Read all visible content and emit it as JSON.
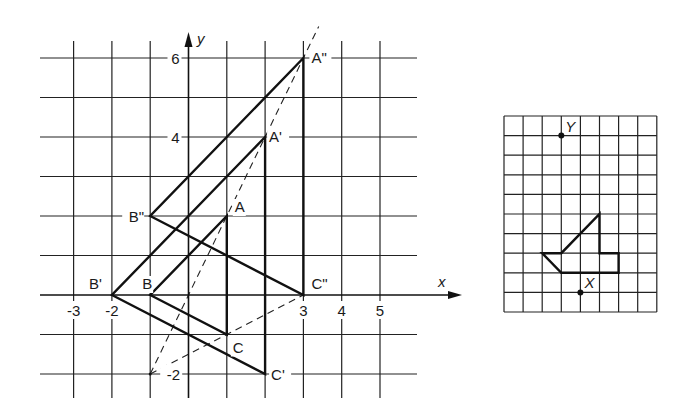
{
  "figure": {
    "left_panel": {
      "title": "Coordinate grid with successive dilations",
      "x_range": [
        -4,
        6
      ],
      "y_range": [
        -3,
        7
      ],
      "axis_labels": {
        "x": "x",
        "y": "y"
      },
      "x_tick_labels": [
        {
          "value": -3,
          "text": "-3"
        },
        {
          "value": -2,
          "text": "-2"
        },
        {
          "value": 3,
          "text": "3"
        },
        {
          "value": 4,
          "text": "4"
        },
        {
          "value": 5,
          "text": "5"
        }
      ],
      "y_tick_labels": [
        {
          "value": 6,
          "text": "6"
        },
        {
          "value": 4,
          "text": "4"
        },
        {
          "value": -2,
          "text": "-2"
        }
      ],
      "triangles": [
        {
          "name": "ABC",
          "vertices": [
            {
              "label": "A",
              "x": 1,
              "y": 2
            },
            {
              "label": "B",
              "x": -1,
              "y": 0
            },
            {
              "label": "C",
              "x": 1,
              "y": -1
            }
          ]
        },
        {
          "name": "A'B'C'",
          "vertices": [
            {
              "label": "A'",
              "x": 2,
              "y": 4
            },
            {
              "label": "B'",
              "x": -2,
              "y": 0
            },
            {
              "label": "C'",
              "x": 2,
              "y": -2
            }
          ]
        },
        {
          "name": "A''B''C''",
          "vertices": [
            {
              "label": "A\"",
              "x": 3,
              "y": 6
            },
            {
              "label": "B\"",
              "x": -1,
              "y": 2
            },
            {
              "label": "C\"",
              "x": 3,
              "y": 0
            }
          ]
        }
      ],
      "dilation_center": {
        "x": -1,
        "y": -2
      },
      "dashed_rays": [
        {
          "from": {
            "x": -1,
            "y": -2
          },
          "to": {
            "x": 3.4,
            "y": 6.8
          }
        },
        {
          "from": {
            "x": -1,
            "y": -2
          },
          "to": {
            "x": 3,
            "y": 0
          }
        }
      ]
    },
    "right_panel": {
      "columns": 8,
      "rows": 10,
      "polygon": [
        {
          "c": 5,
          "r": 5
        },
        {
          "c": 5,
          "r": 7
        },
        {
          "c": 6,
          "r": 7
        },
        {
          "c": 6,
          "r": 8
        },
        {
          "c": 3,
          "r": 8
        },
        {
          "c": 2,
          "r": 7
        },
        {
          "c": 3,
          "r": 7
        }
      ],
      "points": [
        {
          "label": "Y",
          "c": 3,
          "r": 1
        },
        {
          "label": "X",
          "c": 4,
          "r": 9
        }
      ]
    }
  }
}
